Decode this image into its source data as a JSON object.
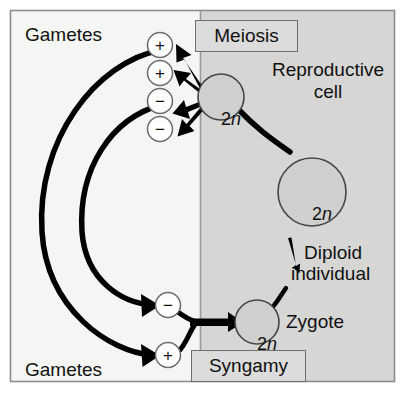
{
  "figure": {
    "frame_border_color": "#8c8c8c",
    "left_panel_color": "#f5f5f3",
    "right_panel_color": "#d6d6d4",
    "divider_color": "#9a9a9a",
    "stroke_color": "#000000",
    "circle_fill_left": "#ffffff",
    "circle_border_left": "#6b6b6b",
    "circle_fill_right": "#cfcfcd",
    "circle_border_right": "#444444"
  },
  "labels": {
    "gametes_top": "Gametes",
    "gametes_bottom": "Gametes",
    "reproductive_cell_line1": "Reproductive",
    "reproductive_cell_line2": "cell",
    "diploid_line1": "Diploid",
    "diploid_line2": "individual",
    "zygote": "Zygote"
  },
  "process_boxes": [
    {
      "name": "meiosis",
      "label": "Meiosis"
    },
    {
      "name": "syngamy",
      "label": "Syngamy"
    }
  ],
  "cells": {
    "reproductive_cell": {
      "prefix": "2",
      "italic": "n"
    },
    "diploid_individual": {
      "prefix": "2",
      "italic": "n"
    },
    "zygote": {
      "prefix": "2",
      "italic": "n"
    }
  },
  "meiosis_gametes": [
    {
      "name": "gamete-plus-1",
      "sign": "+"
    },
    {
      "name": "gamete-plus-2",
      "sign": "+"
    },
    {
      "name": "gamete-minus-1",
      "sign": "−"
    },
    {
      "name": "gamete-minus-2",
      "sign": "−"
    }
  ],
  "syngamy_gametes": [
    {
      "name": "gamete-minus-fusing",
      "sign": "−"
    },
    {
      "name": "gamete-plus-fusing",
      "sign": "+"
    }
  ]
}
